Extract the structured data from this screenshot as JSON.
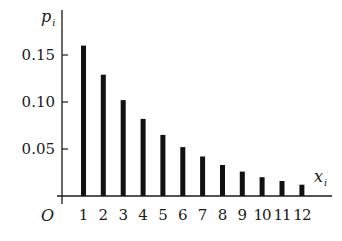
{
  "chart_data": {
    "type": "bar",
    "title": "",
    "xlabel": "x_i",
    "ylabel": "p_i",
    "xlabel_main": "x",
    "xlabel_sub": "i",
    "ylabel_main": "p",
    "ylabel_sub": "i",
    "origin_label": "O",
    "categories": [
      "1",
      "2",
      "3",
      "4",
      "5",
      "6",
      "7",
      "8",
      "9",
      "10",
      "11",
      "12"
    ],
    "values": [
      0.16,
      0.129,
      0.102,
      0.082,
      0.065,
      0.052,
      0.042,
      0.033,
      0.026,
      0.02,
      0.016,
      0.012
    ],
    "yticks": [
      0.05,
      0.1,
      0.15
    ],
    "ytick_labels": [
      "0.05",
      "0.10",
      "0.15"
    ],
    "ylim": [
      0,
      0.17
    ],
    "grid": false,
    "legend": null,
    "bar_color": "#111111"
  }
}
